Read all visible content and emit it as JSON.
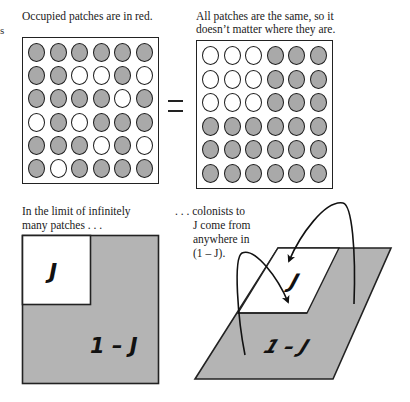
{
  "fragments": {
    "clipped_left_text": "s"
  },
  "panels": {
    "top_left": {
      "caption": "Occupied patches are in red.",
      "grid": [
        [
          1,
          1,
          1,
          1,
          1,
          1
        ],
        [
          1,
          1,
          0,
          0,
          1,
          0
        ],
        [
          1,
          1,
          1,
          1,
          0,
          1
        ],
        [
          0,
          1,
          0,
          1,
          1,
          1
        ],
        [
          1,
          1,
          1,
          0,
          1,
          0
        ],
        [
          1,
          0,
          1,
          1,
          1,
          1
        ]
      ]
    },
    "equals_sign": "=",
    "top_right": {
      "caption_line1": "All patches are the same, so it",
      "caption_line2": "doesn’t matter where they are.",
      "grid": [
        [
          0,
          0,
          0,
          1,
          1,
          1
        ],
        [
          0,
          0,
          0,
          1,
          1,
          1
        ],
        [
          0,
          0,
          0,
          1,
          1,
          1
        ],
        [
          1,
          1,
          1,
          1,
          1,
          1
        ],
        [
          1,
          1,
          1,
          1,
          1,
          1
        ],
        [
          1,
          1,
          1,
          1,
          1,
          1
        ]
      ]
    },
    "bottom_left": {
      "caption_line1": "In the limit of infinitely",
      "caption_line2": "many patches . . .",
      "label_occupied_fraction": "J",
      "label_empty_fraction": "1 – J"
    },
    "bottom_right": {
      "caption_line1": ". . . colonists to",
      "caption_line2": "J come from",
      "caption_line3": "anywhere in",
      "caption_line4": "(1 – J).",
      "label_occupied_fraction": "J",
      "label_empty_fraction": "1 – J"
    }
  },
  "colors": {
    "filled_patch": "#a9a9a9",
    "empty_patch": "#ffffff",
    "outline": "#1c1c1c",
    "shaded_region": "#b4b4b4"
  }
}
